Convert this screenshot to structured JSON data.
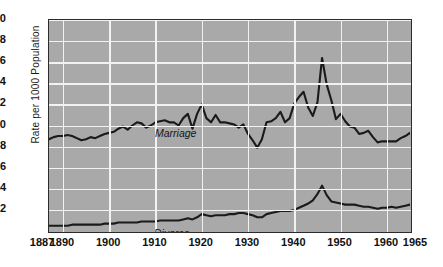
{
  "chart_data": {
    "type": "line",
    "title": "",
    "xlabel": "",
    "ylabel": "Rate per 1000 Population",
    "xlim": [
      1887,
      1965
    ],
    "ylim": [
      0,
      20
    ],
    "grid": true,
    "legend_position": "inline-annotation",
    "x_ticks": [
      1887,
      1890,
      1900,
      1910,
      1920,
      1930,
      1940,
      1950,
      1960,
      1965
    ],
    "x_tick_labels": [
      "1887",
      "1890",
      "1900",
      "1910",
      "1920",
      "1930",
      "1940",
      "1950",
      "1960",
      "1965"
    ],
    "y_ticks": [
      2,
      4,
      6,
      8,
      10,
      12,
      14,
      16,
      18,
      20
    ],
    "y_tick_labels": [
      "2",
      "4",
      "6",
      "8",
      "10",
      "12",
      "14",
      "16",
      "18",
      "20"
    ],
    "annotations": [
      {
        "text": "Marriage",
        "x": 1902,
        "y": 11.4
      },
      {
        "text": "Divorce",
        "x": 1902,
        "y": 2.0
      }
    ],
    "colors": {
      "plot_background": "#a9a9a9",
      "gridline": "#f2f2f2",
      "line": "#1a1a1a",
      "frame": "#2b2b2b",
      "page_background": "#ffffff"
    },
    "x": [
      1887,
      1888,
      1889,
      1890,
      1891,
      1892,
      1893,
      1894,
      1895,
      1896,
      1897,
      1898,
      1899,
      1900,
      1901,
      1902,
      1903,
      1904,
      1905,
      1906,
      1907,
      1908,
      1909,
      1910,
      1911,
      1912,
      1913,
      1914,
      1915,
      1916,
      1917,
      1918,
      1919,
      1920,
      1921,
      1922,
      1923,
      1924,
      1925,
      1926,
      1927,
      1928,
      1929,
      1930,
      1931,
      1932,
      1933,
      1934,
      1935,
      1936,
      1937,
      1938,
      1939,
      1940,
      1941,
      1942,
      1943,
      1944,
      1945,
      1946,
      1947,
      1948,
      1949,
      1950,
      1951,
      1952,
      1953,
      1954,
      1955,
      1956,
      1957,
      1958,
      1959,
      1960,
      1961,
      1962,
      1963,
      1964,
      1965
    ],
    "series": [
      {
        "name": "Marriage",
        "values": [
          8.7,
          8.9,
          9.0,
          9.0,
          9.1,
          9.0,
          8.8,
          8.6,
          8.7,
          8.9,
          8.8,
          9.0,
          9.2,
          9.3,
          9.4,
          9.7,
          9.9,
          9.6,
          10.0,
          10.3,
          10.2,
          9.8,
          10.0,
          10.3,
          10.4,
          10.5,
          10.3,
          10.3,
          10.0,
          10.7,
          11.1,
          9.7,
          11.1,
          12.0,
          10.7,
          10.3,
          11.0,
          10.3,
          10.3,
          10.2,
          10.1,
          9.8,
          10.1,
          9.2,
          8.6,
          7.9,
          8.7,
          10.3,
          10.4,
          10.7,
          11.3,
          10.3,
          10.7,
          12.1,
          12.7,
          13.2,
          11.7,
          10.9,
          12.2,
          16.4,
          13.9,
          12.4,
          10.6,
          11.1,
          10.4,
          9.9,
          9.8,
          9.2,
          9.3,
          9.5,
          8.9,
          8.4,
          8.5,
          8.5,
          8.5,
          8.5,
          8.8,
          9.0,
          9.3
        ]
      },
      {
        "name": "Divorce",
        "values": [
          0.5,
          0.5,
          0.5,
          0.5,
          0.5,
          0.6,
          0.6,
          0.6,
          0.6,
          0.6,
          0.6,
          0.6,
          0.7,
          0.7,
          0.7,
          0.8,
          0.8,
          0.8,
          0.8,
          0.8,
          0.9,
          0.9,
          0.9,
          0.9,
          1.0,
          1.0,
          1.0,
          1.0,
          1.0,
          1.1,
          1.2,
          1.1,
          1.3,
          1.6,
          1.5,
          1.4,
          1.5,
          1.5,
          1.5,
          1.6,
          1.6,
          1.7,
          1.7,
          1.6,
          1.5,
          1.3,
          1.3,
          1.6,
          1.7,
          1.8,
          1.9,
          1.9,
          1.9,
          2.0,
          2.2,
          2.4,
          2.6,
          2.9,
          3.5,
          4.3,
          3.4,
          2.8,
          2.7,
          2.6,
          2.5,
          2.5,
          2.5,
          2.4,
          2.3,
          2.3,
          2.2,
          2.1,
          2.2,
          2.2,
          2.3,
          2.2,
          2.3,
          2.4,
          2.5
        ]
      }
    ]
  }
}
